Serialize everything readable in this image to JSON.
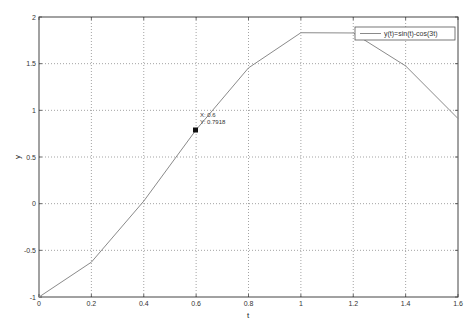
{
  "chart_data": {
    "type": "line",
    "title": "",
    "xlabel": "t",
    "ylabel": "y",
    "xlim": [
      0,
      1.6
    ],
    "ylim": [
      -1,
      2
    ],
    "grid": true,
    "legend_position": "top-right",
    "x_ticks": [
      "0",
      "0.2",
      "0.4",
      "0.6",
      "0.8",
      "1",
      "1.2",
      "1.4",
      "1.6"
    ],
    "y_ticks": [
      "-1",
      "-0.5",
      "0",
      "0.5",
      "1",
      "1.5",
      "2"
    ],
    "series": [
      {
        "name": "y(t)=sin(t)-cos(3t)",
        "color": "#888888",
        "x": [
          0,
          0.2,
          0.4,
          0.6,
          0.8,
          1.0,
          1.2,
          1.4,
          1.6
        ],
        "values": [
          -1,
          -0.6267,
          0.0271,
          0.7918,
          1.4548,
          1.8315,
          1.8288,
          1.4757,
          0.9121
        ]
      }
    ],
    "annotations": [
      {
        "type": "datatip",
        "x": 0.6,
        "y": 0.7918,
        "text_x": "X: 0.6",
        "text_y": "Y: 0.7918"
      }
    ]
  },
  "labels": {
    "xlabel": "t",
    "ylabel": "y",
    "legend": "y(t)=sin(t)-cos(3t)",
    "datatip_x": "X: 0.6",
    "datatip_y": "Y: 0.7918"
  }
}
